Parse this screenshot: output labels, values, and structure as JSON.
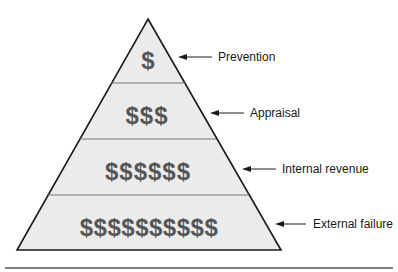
{
  "diagram": {
    "type": "pyramid",
    "colors": {
      "fill": "#ebebeb",
      "outline": "#1a1a1a",
      "divider": "#777777",
      "symbols": "#555555",
      "rule": "#555555"
    },
    "tiers": [
      {
        "symbols": "$",
        "label": "Prevention"
      },
      {
        "symbols": "$$$",
        "label": "Appraisal"
      },
      {
        "symbols": "$$$$$$",
        "label": "Internal revenue"
      },
      {
        "symbols": "$$$$$$$$$$",
        "label": "External failure"
      }
    ]
  }
}
